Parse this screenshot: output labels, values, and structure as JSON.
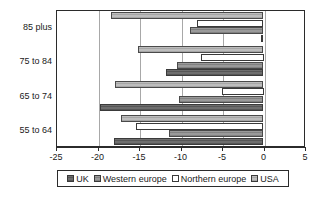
{
  "chart_data": {
    "type": "bar",
    "orientation": "horizontal",
    "title": "",
    "xlabel": "",
    "ylabel": "",
    "categories": [
      "85 plus",
      "75 to 84",
      "65 to 74",
      "55 to 64"
    ],
    "series": [
      {
        "name": "UK",
        "values": [
          -0.3,
          -11.8,
          -19.7,
          -18.0
        ],
        "color": "#6e6e6e"
      },
      {
        "name": "Western europe",
        "values": [
          -8.8,
          -10.4,
          -10.2,
          -11.4
        ],
        "color": "#9a9a9a"
      },
      {
        "name": "Northern europe",
        "values": [
          -8.0,
          -7.5,
          -5.0,
          -15.4
        ],
        "color": "#ffffff"
      },
      {
        "name": "USA",
        "values": [
          -18.4,
          -15.1,
          -17.9,
          -17.2
        ],
        "color": "#bdbdbd"
      }
    ],
    "xlim": [
      -25,
      5
    ],
    "xticks": [
      -25,
      -20,
      -15,
      -10,
      -5,
      0,
      5
    ],
    "xticklabels": [
      "-25",
      "-20",
      "-15",
      "-10",
      "-5",
      "0",
      "5"
    ],
    "grid": true,
    "grid_axis": "x",
    "legend": {
      "position": "bottom",
      "entries": [
        "UK",
        "Western europe",
        "Northern europe",
        "USA"
      ]
    }
  }
}
